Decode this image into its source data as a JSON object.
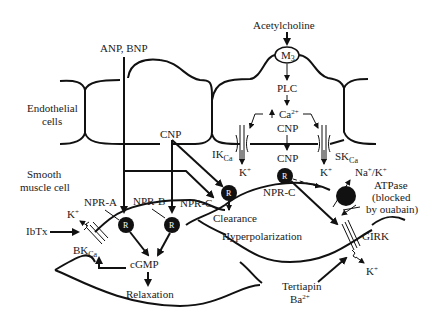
{
  "diagram": {
    "labels": {
      "acetylcholine": "Acetylcholine",
      "m3": "M",
      "m3_sub": "3",
      "plc": "PLC",
      "ca": "Ca",
      "ca_sup": "2+",
      "cnp_endo": "CNP",
      "cnp_left": "CNP",
      "cnp_right": "CNP",
      "anp_bnp": "ANP, BNP",
      "endothelial_1": "Endothelial",
      "endothelial_2": "cells",
      "smooth_1": "Smooth",
      "smooth_2": "muscle cell",
      "ik": "IK",
      "ik_sub": "Ca",
      "sk": "SK",
      "sk_sub": "Ca",
      "k_ik": "K",
      "k_sk": "K",
      "k_sup": "+",
      "npr_a": "NPR-A",
      "npr_b": "NPR-B",
      "npr_c_left": "NPR-C",
      "npr_c_right": "NPR-C",
      "receptor": "R",
      "clearance": "Clearance",
      "hyperpolarization": "Hyperpolarization",
      "k_bk": "K",
      "ibtx": "IbTx",
      "bk": "BK",
      "bk_sub": "Ca",
      "cgmp": "cGMP",
      "relaxation": "Relaxation",
      "na_k": "Na",
      "na_k_2": "/K",
      "atpase": "ATPase",
      "blocked": "(blocked",
      "ouabain": "by ouabain)",
      "girk": "GIRK",
      "k_girk": "K",
      "tertiapin": "Tertiapin",
      "ba": "Ba",
      "ba_sup": "2+"
    }
  }
}
